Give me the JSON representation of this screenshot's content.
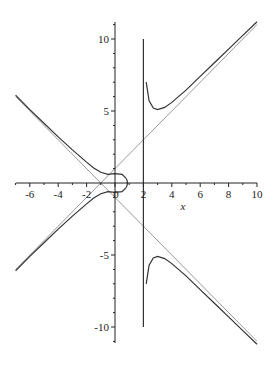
{
  "chart_data": {
    "type": "line",
    "title": "",
    "xlabel": "x",
    "ylabel": "",
    "xlim": [
      -7,
      10
    ],
    "ylim": [
      -11,
      11
    ],
    "grid": false,
    "legend": null,
    "x_ticks": [
      -6,
      -4,
      -2,
      0,
      2,
      4,
      6,
      8,
      10
    ],
    "x_tick_labels": [
      "-6",
      "-4",
      "-2",
      "0",
      "2",
      "4",
      "6",
      "8",
      "10"
    ],
    "y_ticks": [
      -10,
      -5,
      5,
      10
    ],
    "y_tick_labels": [
      "-10",
      "-5",
      "5",
      "10"
    ],
    "series": [
      {
        "name": "asymptote y = x + 1",
        "color": "#999999",
        "x": [
          -7,
          10
        ],
        "y": [
          -6,
          11
        ]
      },
      {
        "name": "asymptote y = -(x + 1)",
        "color": "#999999",
        "x": [
          -7,
          10
        ],
        "y": [
          6,
          -11
        ]
      },
      {
        "name": "vertical asymptote x = 2",
        "color": "#333333",
        "x": [
          2,
          2
        ],
        "y": [
          -10,
          10
        ]
      },
      {
        "name": "curve upper-left branch",
        "color": "#333333",
        "x": [
          -7,
          -6,
          -5,
          -4,
          -3,
          -2,
          -1.5,
          -1,
          -0.5,
          0,
          0.5,
          0.8
        ],
        "y": [
          6.1,
          5.1,
          4.15,
          3.2,
          2.3,
          1.45,
          1.05,
          0.75,
          0.6,
          0.65,
          0.6,
          0.3
        ]
      },
      {
        "name": "curve lower-left branch",
        "color": "#333333",
        "x": [
          -7,
          -6,
          -5,
          -4,
          -3,
          -2,
          -1.5,
          -1,
          -0.5,
          0,
          0.5,
          0.8
        ],
        "y": [
          -6.1,
          -5.1,
          -4.15,
          -3.2,
          -2.3,
          -1.45,
          -1.05,
          -0.75,
          -0.6,
          -0.65,
          -0.6,
          -0.3
        ]
      },
      {
        "name": "curve upper-right branch",
        "color": "#333333",
        "x": [
          2.2,
          2.4,
          2.7,
          3,
          3.5,
          4,
          5,
          6,
          7,
          8,
          9,
          10
        ],
        "y": [
          7.0,
          5.7,
          5.2,
          5.1,
          5.25,
          5.6,
          6.45,
          7.4,
          8.35,
          9.3,
          10.25,
          11.2
        ]
      },
      {
        "name": "curve lower-right branch",
        "color": "#333333",
        "x": [
          2.2,
          2.4,
          2.7,
          3,
          3.5,
          4,
          5,
          6,
          7,
          8,
          9,
          10
        ],
        "y": [
          -7.0,
          -5.7,
          -5.2,
          -5.1,
          -5.25,
          -5.6,
          -6.45,
          -7.4,
          -8.35,
          -9.3,
          -10.25,
          -11.2
        ]
      }
    ]
  },
  "plot": {
    "xlabel": "x",
    "origin_label": "0"
  }
}
